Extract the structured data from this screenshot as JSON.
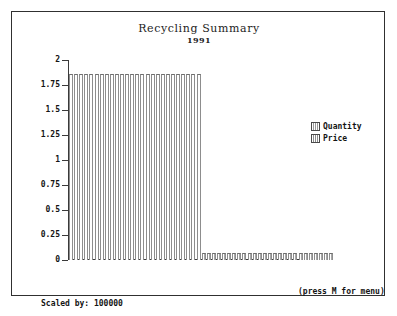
{
  "chart_data": {
    "type": "bar",
    "title": "Recycling Summary",
    "subtitle": "1991",
    "xlabel": "",
    "ylabel": "",
    "ylim": [
      0,
      2
    ],
    "ytick_labels": [
      "2",
      "1.75",
      "1.5",
      "1.25",
      "1",
      "0.75",
      "0.5",
      "0.25",
      "0"
    ],
    "ytick_values": [
      2,
      1.75,
      1.5,
      1.25,
      1,
      0.75,
      0.5,
      0.25,
      0
    ],
    "grid": false,
    "legend_position": "right",
    "series": [
      {
        "name": "Quantity",
        "values": [
          1.87,
          1.87,
          1.87,
          1.87,
          1.87,
          1.87,
          1.87,
          1.87,
          1.87,
          1.87,
          1.87,
          1.87,
          1.87,
          1.87,
          1.87,
          1.87,
          1.87,
          1.87,
          1.87,
          1.87,
          1.87,
          1.87,
          1.87,
          1.87,
          1.87,
          1.87
        ]
      },
      {
        "name": "Price",
        "values": [
          0.07,
          0.07,
          0.07,
          0.07,
          0.07,
          0.07,
          0.07,
          0.07,
          0.07,
          0.07,
          0.07,
          0.07,
          0.07,
          0.07,
          0.07,
          0.07,
          0.07,
          0.07,
          0.07,
          0.07,
          0.07,
          0.07,
          0.07,
          0.07,
          0.07,
          0.07
        ]
      }
    ],
    "categories": [
      "1",
      "2",
      "3",
      "4",
      "5",
      "6",
      "7",
      "8",
      "9",
      "10",
      "11",
      "12",
      "13",
      "14",
      "15",
      "16",
      "17",
      "18",
      "19",
      "20",
      "21",
      "22",
      "23",
      "24",
      "25",
      "26"
    ],
    "annotations": [
      "Scaled by: 100000",
      "(press M for menu)"
    ]
  },
  "legend": {
    "items": [
      {
        "label": "Quantity",
        "swatch": "quantity-swatch"
      },
      {
        "label": "Price",
        "swatch": "price-swatch"
      }
    ]
  },
  "footer": {
    "scaled_by": "Scaled by: 100000",
    "menu_hint": "(press M for menu)"
  },
  "colors": {
    "frame": "#303030",
    "axis": "#3a3a3a",
    "bar_outline": "#8d8d8d",
    "text": "#141414",
    "background": "#ffffff"
  }
}
